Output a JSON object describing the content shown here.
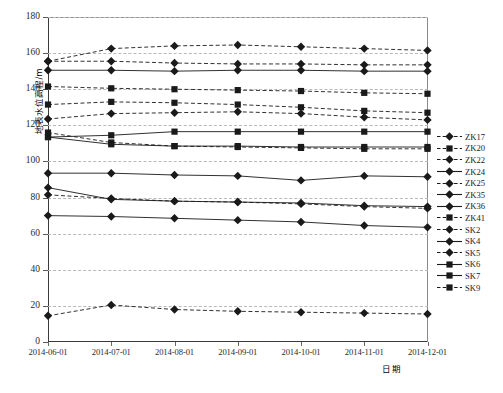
{
  "chart_data": {
    "type": "line",
    "title": "",
    "xlabel": "日期",
    "ylabel": "地表水位高程/m",
    "ylim": [
      0,
      180
    ],
    "yticks": [
      0,
      20,
      40,
      60,
      80,
      100,
      120,
      140,
      160,
      180
    ],
    "grid": true,
    "legend_position": "right",
    "categories": [
      "2014-06-01",
      "2014-07-01",
      "2014-08-01",
      "2014-09-01",
      "2014-10-01",
      "2014-11-01",
      "2014-12-01"
    ],
    "series": [
      {
        "name": "ZK17",
        "marker": "diamond",
        "line": "dashed",
        "values": [
          155.5,
          162.5,
          164.0,
          164.5,
          163.5,
          162.5,
          161.5
        ]
      },
      {
        "name": "ZK20",
        "marker": "square",
        "line": "dashed",
        "values": [
          141.5,
          140.5,
          140.0,
          139.5,
          139.0,
          138.0,
          137.5
        ]
      },
      {
        "name": "ZK22",
        "marker": "diamond",
        "line": "dashed",
        "values": [
          123.5,
          126.5,
          127.0,
          127.5,
          126.5,
          124.5,
          123.0
        ]
      },
      {
        "name": "ZK24",
        "marker": "diamond",
        "line": "solid",
        "values": [
          150.5,
          150.5,
          150.0,
          150.5,
          150.5,
          150.0,
          150.0
        ]
      },
      {
        "name": "ZK25",
        "marker": "diamond",
        "line": "dashed",
        "values": [
          155.5,
          155.5,
          154.5,
          154.0,
          154.0,
          153.5,
          153.5
        ]
      },
      {
        "name": "ZK35",
        "marker": "diamond",
        "line": "solid",
        "values": [
          93.5,
          93.5,
          92.5,
          92.0,
          89.5,
          92.0,
          91.5
        ]
      },
      {
        "name": "ZK36",
        "marker": "diamond",
        "line": "solid",
        "values": [
          85.5,
          79.0,
          78.0,
          77.5,
          77.0,
          75.5,
          75.0
        ]
      },
      {
        "name": "ZK41",
        "marker": "square",
        "line": "dashed",
        "values": [
          131.5,
          133.0,
          132.5,
          131.5,
          130.0,
          128.0,
          127.0
        ]
      },
      {
        "name": "SK2",
        "marker": "diamond",
        "line": "dashed",
        "values": [
          81.5,
          79.5,
          78.0,
          77.5,
          76.5,
          75.0,
          74.0
        ]
      },
      {
        "name": "SK4",
        "marker": "diamond",
        "line": "solid",
        "values": [
          70.0,
          69.5,
          68.5,
          67.5,
          66.5,
          64.5,
          63.5
        ]
      },
      {
        "name": "SK5",
        "marker": "diamond",
        "line": "dashed",
        "values": [
          14.5,
          20.5,
          18.0,
          17.0,
          16.5,
          16.0,
          15.5
        ]
      },
      {
        "name": "SK6",
        "marker": "square",
        "line": "solid",
        "values": [
          113.5,
          114.5,
          116.5,
          116.5,
          116.5,
          116.5,
          116.5
        ]
      },
      {
        "name": "SK7",
        "marker": "square",
        "line": "solid",
        "values": [
          113.5,
          109.5,
          108.5,
          108.5,
          108.0,
          108.0,
          108.0
        ]
      },
      {
        "name": "SK9",
        "marker": "square",
        "line": "dashed",
        "values": [
          116.0,
          110.5,
          108.5,
          108.0,
          107.5,
          107.0,
          107.0
        ]
      }
    ]
  },
  "legend": {
    "items": [
      {
        "label": "ZK17"
      },
      {
        "label": "ZK20"
      },
      {
        "label": "ZK22"
      },
      {
        "label": "ZK24"
      },
      {
        "label": "ZK25"
      },
      {
        "label": "ZK35"
      },
      {
        "label": "ZK36"
      },
      {
        "label": "ZK41"
      },
      {
        "label": "SK2"
      },
      {
        "label": "SK4"
      },
      {
        "label": "SK5"
      },
      {
        "label": "SK6"
      },
      {
        "label": "SK7"
      },
      {
        "label": "SK9"
      }
    ]
  },
  "colors": {
    "line": "#1a1a1a",
    "grid": "#b9b9b9",
    "axis": "#3a3a3a",
    "text": "#1a1a1a",
    "background": "#ffffff"
  }
}
